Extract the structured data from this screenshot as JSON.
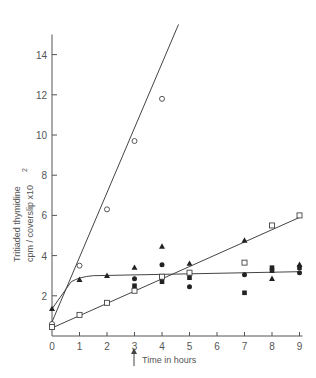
{
  "chart_data": {
    "type": "line",
    "title": "",
    "xlabel": "Time in hours",
    "ylabel_line1": "Tritiaded thymidine",
    "ylabel_line2": "cpm / coverslip x10",
    "ylabel_exponent": "2",
    "xlim": [
      0,
      9
    ],
    "ylim": [
      0,
      15
    ],
    "x_ticks": [
      "0",
      "1",
      "2",
      "3",
      "4",
      "5",
      "6",
      "7",
      "8",
      "9"
    ],
    "y_ticks": [
      "2",
      "4",
      "6",
      "8",
      "10",
      "12",
      "14"
    ],
    "grid": false,
    "legend": "none",
    "annotation": {
      "type": "arrow",
      "x": 3,
      "label": "arrow under x=3"
    },
    "series": [
      {
        "name": "open circles",
        "marker": "open-circle",
        "points": [
          [
            0,
            0.6
          ],
          [
            1,
            3.5
          ],
          [
            2,
            6.3
          ],
          [
            3,
            9.7
          ],
          [
            4,
            11.8
          ]
        ],
        "fit_line": [
          [
            0,
            0.7
          ],
          [
            4.6,
            15.5
          ]
        ]
      },
      {
        "name": "open squares",
        "marker": "open-square",
        "points": [
          [
            0,
            0.45
          ],
          [
            1,
            1.05
          ],
          [
            2,
            1.65
          ],
          [
            3,
            2.25
          ],
          [
            4,
            2.95
          ],
          [
            5,
            3.15
          ],
          [
            7,
            3.65
          ],
          [
            8,
            5.5
          ],
          [
            9,
            6.0
          ]
        ],
        "fit_line": [
          [
            0,
            0.4
          ],
          [
            9,
            5.9
          ]
        ]
      },
      {
        "name": "filled triangles",
        "marker": "filled-triangle",
        "points": [
          [
            0,
            1.35
          ],
          [
            1,
            2.8
          ],
          [
            2,
            3.0
          ],
          [
            3,
            3.4
          ],
          [
            4,
            4.45
          ],
          [
            5,
            3.6
          ],
          [
            7,
            4.75
          ],
          [
            8,
            2.85
          ],
          [
            9,
            3.55
          ]
        ],
        "fit_line": [
          [
            0,
            1.35
          ],
          [
            0.7,
            2.7
          ],
          [
            1,
            2.95
          ],
          [
            1.5,
            3.0
          ],
          [
            9,
            3.2
          ]
        ]
      },
      {
        "name": "filled circles",
        "marker": "filled-circle",
        "points": [
          [
            3,
            2.85
          ],
          [
            4,
            3.55
          ],
          [
            5,
            2.45
          ],
          [
            7,
            3.05
          ],
          [
            9,
            3.15
          ]
        ],
        "fit_line": []
      },
      {
        "name": "filled squares",
        "marker": "filled-square",
        "points": [
          [
            3,
            2.5
          ],
          [
            4,
            2.7
          ],
          [
            5,
            2.9
          ],
          [
            7,
            2.15
          ],
          [
            8,
            3.4
          ],
          [
            8,
            3.25
          ],
          [
            9,
            3.4
          ]
        ],
        "fit_line": []
      }
    ]
  }
}
